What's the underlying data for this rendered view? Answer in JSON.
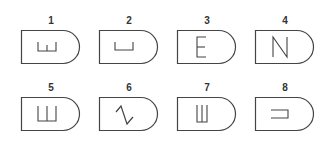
{
  "figure": {
    "stroke_color": "#444444",
    "label_color": "#333333",
    "background": "#ffffff",
    "items": [
      {
        "number": "1",
        "symbol": "open-bracket-with-center-tick",
        "glyph_name": "shallow-E-rotated-icon",
        "row": 1,
        "col": 1
      },
      {
        "number": "2",
        "symbol": "open-bracket",
        "glyph_name": "u-bracket-icon",
        "row": 1,
        "col": 2
      },
      {
        "number": "3",
        "symbol": "E",
        "glyph_name": "letter-e-icon",
        "row": 1,
        "col": 3
      },
      {
        "number": "4",
        "symbol": "N",
        "glyph_name": "letter-n-icon",
        "row": 1,
        "col": 4
      },
      {
        "number": "5",
        "symbol": "Ш (wide)",
        "glyph_name": "sha-wide-icon",
        "row": 2,
        "col": 1
      },
      {
        "number": "6",
        "symbol": "zigzag",
        "glyph_name": "zigzag-icon",
        "row": 2,
        "col": 2
      },
      {
        "number": "7",
        "symbol": "Ш (narrow)",
        "glyph_name": "sha-narrow-icon",
        "row": 2,
        "col": 3
      },
      {
        "number": "8",
        "symbol": "sideways bracket",
        "glyph_name": "sideways-bracket-icon",
        "row": 2,
        "col": 4
      }
    ]
  }
}
